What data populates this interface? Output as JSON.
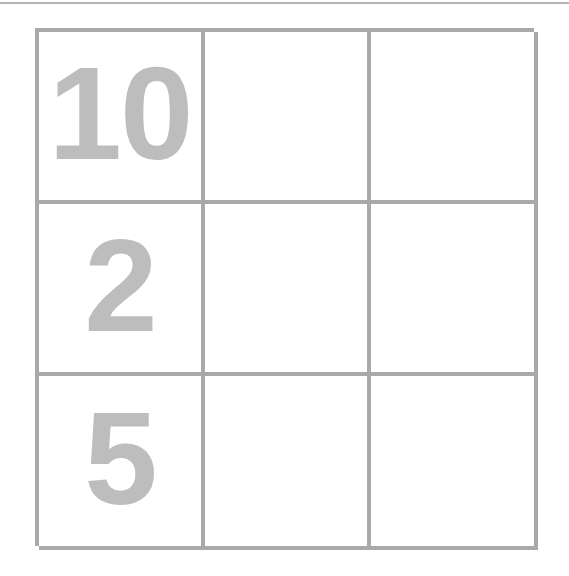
{
  "page": {
    "background_color": "#ffffff"
  },
  "top_rule": {
    "color": "#b4b4b4"
  },
  "grid": {
    "rows": 3,
    "columns": 3,
    "border_color": "#a9a9a9",
    "cell_background": "#ffffff",
    "value_color": "#bdbdbd",
    "cells": [
      [
        {
          "value": "10",
          "filled": true
        },
        {
          "value": "",
          "filled": false
        },
        {
          "value": "",
          "filled": false
        }
      ],
      [
        {
          "value": "2",
          "filled": true
        },
        {
          "value": "",
          "filled": false
        },
        {
          "value": "",
          "filled": false
        }
      ],
      [
        {
          "value": "5",
          "filled": true
        },
        {
          "value": "",
          "filled": false
        },
        {
          "value": "",
          "filled": false
        }
      ]
    ]
  }
}
